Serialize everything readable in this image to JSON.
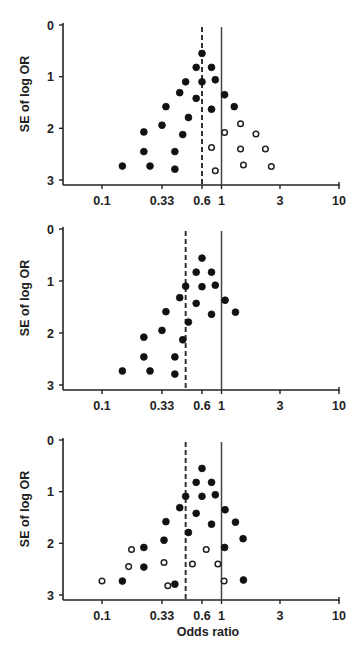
{
  "chart_data": [
    {
      "type": "scatter",
      "title": "",
      "panel": 1,
      "xlabel": "",
      "ylabel": "SE of log OR",
      "xscale": "log",
      "xticks": [
        0.1,
        0.33,
        0.6,
        1,
        3,
        10
      ],
      "xtick_labels": [
        "0.1",
        "0.33",
        "0.6",
        "1",
        "3",
        "10"
      ],
      "yticks": [
        0,
        1,
        2,
        3
      ],
      "ytick_labels": [
        "0",
        "1",
        "2",
        "3"
      ],
      "ylim": [
        0,
        3
      ],
      "y_inverted": true,
      "grid": false,
      "reference_lines": [
        {
          "name": "null effect",
          "x": 1,
          "style": "solid"
        },
        {
          "name": "pooled estimate",
          "x": 0.6,
          "style": "dashed"
        }
      ],
      "series": [
        {
          "name": "observed studies",
          "marker": "filled",
          "points": [
            {
              "or": 0.6,
              "se": 0.55
            },
            {
              "or": 0.55,
              "se": 0.82
            },
            {
              "or": 0.77,
              "se": 0.82
            },
            {
              "or": 0.47,
              "se": 1.1
            },
            {
              "or": 0.6,
              "se": 1.1
            },
            {
              "or": 0.85,
              "se": 1.06
            },
            {
              "or": 0.43,
              "se": 1.31
            },
            {
              "or": 0.55,
              "se": 1.42
            },
            {
              "or": 1.06,
              "se": 1.35
            },
            {
              "or": 0.35,
              "se": 1.58
            },
            {
              "or": 0.77,
              "se": 1.63
            },
            {
              "or": 1.27,
              "se": 1.58
            },
            {
              "or": 0.49,
              "se": 1.79
            },
            {
              "or": 0.33,
              "se": 1.94
            },
            {
              "or": 0.23,
              "se": 2.07
            },
            {
              "or": 0.45,
              "se": 2.12
            },
            {
              "or": 0.23,
              "se": 2.45
            },
            {
              "or": 0.4,
              "se": 2.45
            },
            {
              "or": 0.15,
              "se": 2.73
            },
            {
              "or": 0.26,
              "se": 2.73
            },
            {
              "or": 0.4,
              "se": 2.79
            }
          ]
        },
        {
          "name": "imputed (missing) studies",
          "marker": "open",
          "points": [
            {
              "or": 1.43,
              "se": 1.91
            },
            {
              "or": 1.06,
              "se": 2.08
            },
            {
              "or": 1.91,
              "se": 2.11
            },
            {
              "or": 0.77,
              "se": 2.37
            },
            {
              "or": 1.43,
              "se": 2.4
            },
            {
              "or": 2.28,
              "se": 2.4
            },
            {
              "or": 1.51,
              "se": 2.71
            },
            {
              "or": 2.55,
              "se": 2.74
            },
            {
              "or": 0.85,
              "se": 2.82
            }
          ]
        }
      ]
    },
    {
      "type": "scatter",
      "title": "",
      "panel": 2,
      "xlabel": "",
      "ylabel": "SE of log OR",
      "xscale": "log",
      "xticks": [
        0.1,
        0.33,
        0.6,
        1,
        3,
        10
      ],
      "xtick_labels": [
        "0.1",
        "0.33",
        "0.6",
        "1",
        "3",
        "10"
      ],
      "yticks": [
        0,
        1,
        2,
        3
      ],
      "ytick_labels": [
        "0",
        "1",
        "2",
        "3"
      ],
      "ylim": [
        0,
        3
      ],
      "y_inverted": true,
      "grid": false,
      "reference_lines": [
        {
          "name": "null effect",
          "x": 1,
          "style": "solid"
        },
        {
          "name": "pooled estimate",
          "x": 0.47,
          "style": "dashed"
        }
      ],
      "series": [
        {
          "name": "observed studies",
          "marker": "filled",
          "points": [
            {
              "or": 0.6,
              "se": 0.56
            },
            {
              "or": 0.55,
              "se": 0.83
            },
            {
              "or": 0.77,
              "se": 0.83
            },
            {
              "or": 0.47,
              "se": 1.1
            },
            {
              "or": 0.6,
              "se": 1.11
            },
            {
              "or": 0.85,
              "se": 1.08
            },
            {
              "or": 0.43,
              "se": 1.32
            },
            {
              "or": 0.55,
              "se": 1.43
            },
            {
              "or": 1.07,
              "se": 1.37
            },
            {
              "or": 0.35,
              "se": 1.59
            },
            {
              "or": 0.77,
              "se": 1.64
            },
            {
              "or": 1.3,
              "se": 1.6
            },
            {
              "or": 0.49,
              "se": 1.79
            },
            {
              "or": 0.33,
              "se": 1.95
            },
            {
              "or": 0.23,
              "se": 2.08
            },
            {
              "or": 0.45,
              "se": 2.13
            },
            {
              "or": 0.23,
              "se": 2.46
            },
            {
              "or": 0.4,
              "se": 2.46
            },
            {
              "or": 0.15,
              "se": 2.73
            },
            {
              "or": 0.26,
              "se": 2.73
            },
            {
              "or": 0.4,
              "se": 2.79
            }
          ]
        }
      ]
    },
    {
      "type": "scatter",
      "title": "",
      "panel": 3,
      "xlabel": "Odds ratio",
      "ylabel": "SE of log OR",
      "xscale": "log",
      "xticks": [
        0.1,
        0.33,
        0.6,
        1,
        3,
        10
      ],
      "xtick_labels": [
        "0.1",
        "0.33",
        "0.6",
        "1",
        "3",
        "10"
      ],
      "yticks": [
        0,
        1,
        2,
        3
      ],
      "ytick_labels": [
        "0",
        "1",
        "2",
        "3"
      ],
      "ylim": [
        0,
        3
      ],
      "y_inverted": true,
      "grid": false,
      "reference_lines": [
        {
          "name": "null effect",
          "x": 1,
          "style": "solid"
        },
        {
          "name": "pooled estimate",
          "x": 0.47,
          "style": "dashed"
        }
      ],
      "series": [
        {
          "name": "observed studies",
          "marker": "filled",
          "points": [
            {
              "or": 0.6,
              "se": 0.55
            },
            {
              "or": 0.55,
              "se": 0.82
            },
            {
              "or": 0.77,
              "se": 0.82
            },
            {
              "or": 0.47,
              "se": 1.09
            },
            {
              "or": 0.6,
              "se": 1.09
            },
            {
              "or": 0.85,
              "se": 1.06
            },
            {
              "or": 0.43,
              "se": 1.31
            },
            {
              "or": 0.55,
              "se": 1.42
            },
            {
              "or": 1.07,
              "se": 1.35
            },
            {
              "or": 0.35,
              "se": 1.58
            },
            {
              "or": 0.77,
              "se": 1.63
            },
            {
              "or": 1.3,
              "se": 1.59
            },
            {
              "or": 0.49,
              "se": 1.79
            },
            {
              "or": 0.34,
              "se": 1.94
            },
            {
              "or": 1.5,
              "se": 1.91
            },
            {
              "or": 0.23,
              "se": 2.08
            },
            {
              "or": 1.06,
              "se": 2.08
            },
            {
              "or": 0.23,
              "se": 2.46
            },
            {
              "or": 0.15,
              "se": 2.73
            },
            {
              "or": 0.4,
              "se": 2.79
            },
            {
              "or": 1.51,
              "se": 2.71
            }
          ]
        },
        {
          "name": "additional studies",
          "marker": "open",
          "points": [
            {
              "or": 0.18,
              "se": 2.12
            },
            {
              "or": 0.67,
              "se": 2.12
            },
            {
              "or": 0.17,
              "se": 2.45
            },
            {
              "or": 0.34,
              "se": 2.37
            },
            {
              "or": 0.52,
              "se": 2.4
            },
            {
              "or": 0.91,
              "se": 2.4
            },
            {
              "or": 0.1,
              "se": 2.73
            },
            {
              "or": 0.36,
              "se": 2.82
            },
            {
              "or": 1.05,
              "se": 2.73
            }
          ]
        }
      ]
    }
  ],
  "layout": {
    "width": 364,
    "height": 651,
    "x_axis_px": {
      "0.1": 102,
      "0.33": 162,
      "0.6": 202,
      "1": 221.5,
      "3": 280,
      "10": 339
    },
    "x_axis_start_px": 63,
    "panels": [
      {
        "y0_px": 25,
        "y3_px": 180,
        "axis_y_px": 185,
        "ylabel_center_y": 94
      },
      {
        "y0_px": 229,
        "y3_px": 385,
        "axis_y_px": 390,
        "ylabel_center_y": 298
      },
      {
        "y0_px": 440,
        "y3_px": 595,
        "axis_y_px": 600,
        "ylabel_center_y": 509
      }
    ]
  }
}
